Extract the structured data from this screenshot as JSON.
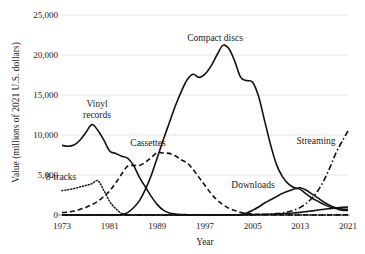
{
  "chart_data": {
    "type": "line",
    "title": "",
    "xlabel": "Year",
    "ylabel": "Value (millions of 2021 U.S. dollars)",
    "xlim": [
      1973,
      2021
    ],
    "ylim": [
      0,
      25000
    ],
    "grid": true,
    "legend_position": "inline-annotations",
    "x_ticks": [
      "1973",
      "1981",
      "1989",
      "1997",
      "2005",
      "2013",
      "2021"
    ],
    "x_tick_values": [
      1973,
      1981,
      1989,
      1997,
      2005,
      2013,
      2021
    ],
    "y_ticks": [
      "0",
      "5,000",
      "10,000",
      "15,000",
      "20,000",
      "25,000"
    ],
    "y_tick_values": [
      0,
      5000,
      10000,
      15000,
      20000,
      25000
    ],
    "x": [
      1973,
      1974,
      1975,
      1976,
      1977,
      1978,
      1979,
      1980,
      1981,
      1982,
      1983,
      1984,
      1985,
      1986,
      1987,
      1988,
      1989,
      1990,
      1991,
      1992,
      1993,
      1994,
      1995,
      1996,
      1997,
      1998,
      1999,
      2000,
      2001,
      2002,
      2003,
      2004,
      2005,
      2006,
      2007,
      2008,
      2009,
      2010,
      2011,
      2012,
      2013,
      2014,
      2015,
      2016,
      2017,
      2018,
      2019,
      2020,
      2021
    ],
    "series": [
      {
        "name": "Vinyl records",
        "style": "solid",
        "values": [
          8700,
          8600,
          8750,
          9350,
          10300,
          11300,
          10600,
          9400,
          8000,
          7700,
          7350,
          7100,
          6200,
          4700,
          3500,
          2300,
          1300,
          600,
          250,
          120,
          60,
          40,
          30,
          30,
          30,
          30,
          30,
          30,
          30,
          30,
          30,
          40,
          50,
          60,
          80,
          100,
          130,
          160,
          200,
          260,
          330,
          420,
          520,
          620,
          720,
          800,
          880,
          950,
          1000
        ]
      },
      {
        "name": "8-tracks",
        "style": "dotted",
        "values": [
          3050,
          3150,
          3300,
          3500,
          3700,
          3900,
          4300,
          3100,
          1700,
          800,
          200,
          40,
          0,
          0,
          0,
          0,
          0,
          0,
          0,
          0,
          0,
          0,
          0,
          0,
          0,
          0,
          0,
          0,
          0,
          0,
          0,
          0,
          0,
          0,
          0,
          0,
          0,
          0,
          0,
          0,
          0,
          0,
          0,
          0,
          0,
          0,
          0,
          0,
          0
        ]
      },
      {
        "name": "Cassettes",
        "style": "dashed",
        "values": [
          300,
          350,
          500,
          700,
          950,
          1300,
          1700,
          2300,
          3000,
          4000,
          5100,
          6100,
          6200,
          6200,
          6600,
          7200,
          7800,
          7750,
          7700,
          7400,
          6900,
          6500,
          5700,
          4700,
          3700,
          2700,
          1900,
          1300,
          850,
          550,
          320,
          200,
          120,
          70,
          40,
          25,
          15,
          10,
          8,
          6,
          5,
          5,
          5,
          6,
          8,
          10,
          12,
          14,
          16
        ]
      },
      {
        "name": "Compact discs",
        "style": "solid",
        "values": [
          0,
          0,
          0,
          0,
          0,
          0,
          0,
          0,
          0,
          0,
          60,
          300,
          900,
          1800,
          3200,
          5000,
          7200,
          9400,
          11500,
          13600,
          15400,
          16900,
          17600,
          17200,
          17600,
          18600,
          20000,
          21200,
          20800,
          19200,
          17200,
          16800,
          16600,
          14800,
          11800,
          8800,
          6300,
          4800,
          3900,
          3400,
          3200,
          2600,
          2100,
          1700,
          1300,
          1000,
          800,
          600,
          580
        ]
      },
      {
        "name": "Downloads",
        "style": "solid",
        "values": [
          0,
          0,
          0,
          0,
          0,
          0,
          0,
          0,
          0,
          0,
          0,
          0,
          0,
          0,
          0,
          0,
          0,
          0,
          0,
          0,
          0,
          0,
          0,
          0,
          0,
          0,
          0,
          0,
          0,
          0,
          60,
          250,
          600,
          1000,
          1500,
          1900,
          2300,
          2700,
          3000,
          3250,
          3400,
          3100,
          2600,
          2100,
          1600,
          1200,
          900,
          750,
          700
        ]
      },
      {
        "name": "Streaming",
        "style": "dash-dot",
        "values": [
          0,
          0,
          0,
          0,
          0,
          0,
          0,
          0,
          0,
          0,
          0,
          0,
          0,
          0,
          0,
          0,
          0,
          0,
          0,
          0,
          0,
          0,
          0,
          0,
          0,
          0,
          0,
          0,
          0,
          0,
          0,
          0,
          20,
          40,
          70,
          110,
          170,
          260,
          400,
          620,
          950,
          1450,
          2150,
          3100,
          4400,
          6000,
          7800,
          9200,
          10500
        ]
      }
    ],
    "annotations": [
      {
        "text_line1": "Vinyl",
        "text_line2": "records",
        "series": "Vinyl records"
      },
      {
        "text_line1": "8-tracks",
        "text_line2": "",
        "series": "8-tracks"
      },
      {
        "text_line1": "Cassettes",
        "text_line2": "",
        "series": "Cassettes"
      },
      {
        "text_line1": "Compact discs",
        "text_line2": "",
        "series": "Compact discs"
      },
      {
        "text_line1": "Downloads",
        "text_line2": "",
        "series": "Downloads"
      },
      {
        "text_line1": "Streaming",
        "text_line2": "",
        "series": "Streaming"
      }
    ],
    "colors": {
      "line": "#111111",
      "grid": "#e3e3e3",
      "axis": "#8a8a8a",
      "text": "#1a1a1a",
      "background": "#ffffff"
    }
  }
}
